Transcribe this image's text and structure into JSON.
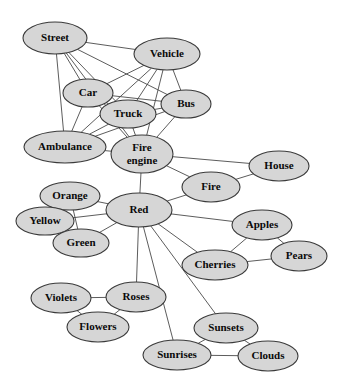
{
  "graph": {
    "title": "Semantic network of concepts",
    "node_fill_color": "#d6d6d6",
    "node_stroke_color": "#3a3a3a",
    "edge_color": "#4a4a4a",
    "background_color": "#ffffff",
    "nodes": [
      {
        "id": "street",
        "label": "Street",
        "x": 55,
        "y": 38,
        "rx": 32,
        "ry": 16,
        "font_size": 11
      },
      {
        "id": "vehicle",
        "label": "Vehicle",
        "x": 167,
        "y": 54,
        "rx": 33,
        "ry": 16,
        "font_size": 11
      },
      {
        "id": "car",
        "label": "Car",
        "x": 88,
        "y": 93,
        "rx": 25,
        "ry": 14,
        "font_size": 11
      },
      {
        "id": "truck",
        "label": "Truck",
        "x": 128,
        "y": 114,
        "rx": 28,
        "ry": 14,
        "font_size": 11
      },
      {
        "id": "bus",
        "label": "Bus",
        "x": 186,
        "y": 104,
        "rx": 25,
        "ry": 14,
        "font_size": 11
      },
      {
        "id": "ambulance",
        "label": "Ambulance",
        "x": 65,
        "y": 147,
        "rx": 41,
        "ry": 16,
        "font_size": 11
      },
      {
        "id": "fire_engine",
        "label": "Fire engine",
        "x": 142,
        "y": 154,
        "rx": 31,
        "ry": 19,
        "font_size": 11,
        "two_line": true,
        "line1": "Fire",
        "line2": "engine"
      },
      {
        "id": "house",
        "label": "House",
        "x": 279,
        "y": 166,
        "rx": 30,
        "ry": 15,
        "font_size": 11
      },
      {
        "id": "fire",
        "label": "Fire",
        "x": 211,
        "y": 187,
        "rx": 29,
        "ry": 15,
        "font_size": 11
      },
      {
        "id": "orange",
        "label": "Orange",
        "x": 70,
        "y": 196,
        "rx": 30,
        "ry": 14,
        "font_size": 11
      },
      {
        "id": "yellow",
        "label": "Yellow",
        "x": 45,
        "y": 221,
        "rx": 29,
        "ry": 14,
        "font_size": 11
      },
      {
        "id": "green",
        "label": "Green",
        "x": 81,
        "y": 243,
        "rx": 28,
        "ry": 14,
        "font_size": 11
      },
      {
        "id": "red",
        "label": "Red",
        "x": 139,
        "y": 210,
        "rx": 33,
        "ry": 17,
        "font_size": 11
      },
      {
        "id": "apples",
        "label": "Apples",
        "x": 262,
        "y": 225,
        "rx": 30,
        "ry": 15,
        "font_size": 11
      },
      {
        "id": "pears",
        "label": "Pears",
        "x": 299,
        "y": 256,
        "rx": 28,
        "ry": 15,
        "font_size": 11
      },
      {
        "id": "cherries",
        "label": "Cherries",
        "x": 215,
        "y": 265,
        "rx": 33,
        "ry": 15,
        "font_size": 11
      },
      {
        "id": "violets",
        "label": "Violets",
        "x": 61,
        "y": 298,
        "rx": 30,
        "ry": 15,
        "font_size": 11
      },
      {
        "id": "roses",
        "label": "Roses",
        "x": 136,
        "y": 297,
        "rx": 30,
        "ry": 15,
        "font_size": 11
      },
      {
        "id": "flowers",
        "label": "Flowers",
        "x": 98,
        "y": 327,
        "rx": 31,
        "ry": 15,
        "font_size": 11
      },
      {
        "id": "sunsets",
        "label": "Sunsets",
        "x": 226,
        "y": 328,
        "rx": 32,
        "ry": 15,
        "font_size": 11
      },
      {
        "id": "sunrises",
        "label": "Sunrises",
        "x": 177,
        "y": 355,
        "rx": 34,
        "ry": 15,
        "font_size": 11
      },
      {
        "id": "clouds",
        "label": "Clouds",
        "x": 268,
        "y": 356,
        "rx": 30,
        "ry": 15,
        "font_size": 11
      }
    ],
    "edges": [
      {
        "from": "street",
        "to": "car"
      },
      {
        "from": "street",
        "to": "truck"
      },
      {
        "from": "street",
        "to": "bus"
      },
      {
        "from": "street",
        "to": "vehicle"
      },
      {
        "from": "street",
        "to": "ambulance"
      },
      {
        "from": "street",
        "to": "fire_engine"
      },
      {
        "from": "vehicle",
        "to": "car"
      },
      {
        "from": "vehicle",
        "to": "truck"
      },
      {
        "from": "vehicle",
        "to": "bus"
      },
      {
        "from": "vehicle",
        "to": "ambulance"
      },
      {
        "from": "vehicle",
        "to": "fire_engine"
      },
      {
        "from": "car",
        "to": "truck"
      },
      {
        "from": "car",
        "to": "bus"
      },
      {
        "from": "car",
        "to": "ambulance"
      },
      {
        "from": "car",
        "to": "fire_engine"
      },
      {
        "from": "truck",
        "to": "bus"
      },
      {
        "from": "truck",
        "to": "ambulance"
      },
      {
        "from": "truck",
        "to": "fire_engine"
      },
      {
        "from": "bus",
        "to": "ambulance"
      },
      {
        "from": "bus",
        "to": "fire_engine"
      },
      {
        "from": "ambulance",
        "to": "fire_engine"
      },
      {
        "from": "fire_engine",
        "to": "fire"
      },
      {
        "from": "fire_engine",
        "to": "house"
      },
      {
        "from": "fire_engine",
        "to": "red"
      },
      {
        "from": "fire",
        "to": "house"
      },
      {
        "from": "fire",
        "to": "red"
      },
      {
        "from": "red",
        "to": "orange"
      },
      {
        "from": "red",
        "to": "yellow"
      },
      {
        "from": "red",
        "to": "green"
      },
      {
        "from": "red",
        "to": "apples"
      },
      {
        "from": "red",
        "to": "cherries"
      },
      {
        "from": "red",
        "to": "roses"
      },
      {
        "from": "red",
        "to": "sunrises"
      },
      {
        "from": "red",
        "to": "sunsets"
      },
      {
        "from": "orange",
        "to": "yellow"
      },
      {
        "from": "orange",
        "to": "green"
      },
      {
        "from": "yellow",
        "to": "green"
      },
      {
        "from": "apples",
        "to": "pears"
      },
      {
        "from": "apples",
        "to": "cherries"
      },
      {
        "from": "cherries",
        "to": "pears"
      },
      {
        "from": "violets",
        "to": "roses"
      },
      {
        "from": "violets",
        "to": "flowers"
      },
      {
        "from": "roses",
        "to": "flowers"
      },
      {
        "from": "sunsets",
        "to": "sunrises"
      },
      {
        "from": "sunsets",
        "to": "clouds"
      },
      {
        "from": "sunrises",
        "to": "clouds"
      }
    ]
  }
}
